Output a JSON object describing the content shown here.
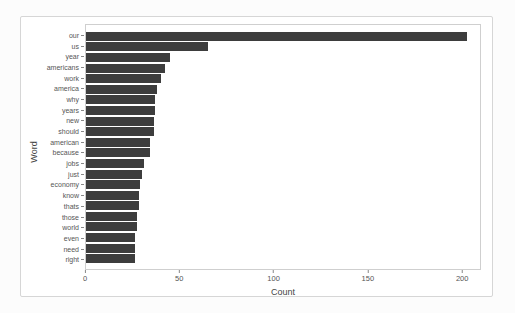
{
  "chart_data": {
    "type": "bar",
    "orientation": "horizontal",
    "title": "",
    "xlabel": "Count",
    "ylabel": "Word",
    "categories": [
      "our",
      "us",
      "year",
      "americans",
      "work",
      "america",
      "why",
      "years",
      "new",
      "should",
      "american",
      "because",
      "jobs",
      "just",
      "economy",
      "know",
      "thats",
      "those",
      "world",
      "even",
      "need",
      "right"
    ],
    "values": [
      203,
      65,
      45,
      42,
      40,
      38,
      37,
      37,
      36,
      36,
      34,
      34,
      31,
      30,
      29,
      28,
      28,
      27,
      27,
      26,
      26,
      26
    ],
    "xticks": [
      0,
      50,
      100,
      150,
      200
    ],
    "xlim": [
      0,
      210
    ],
    "bar_color": "#3d3d3d",
    "axis_text_color": "#555555",
    "axis_title_color": "#444444",
    "panel_border_color": "#cfcfcf",
    "figure_border_color": "#d6d6d6",
    "grid": false,
    "legend": "none"
  }
}
